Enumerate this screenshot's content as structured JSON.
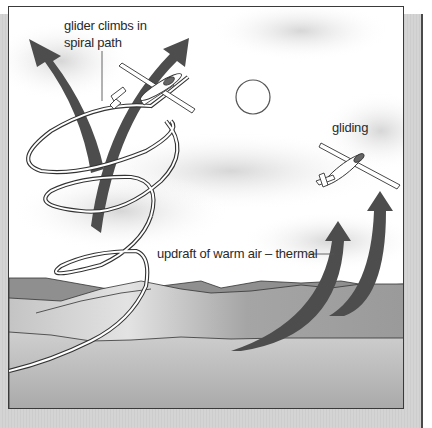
{
  "diagram": {
    "labels": {
      "spiral": "glider climbs in\nspiral path",
      "gliding": "gliding",
      "thermal": "updraft of warm air – thermal"
    },
    "elements": {
      "sun": "sun-outline",
      "glider_climbing": "glider-climbing-in-spiral",
      "glider_gliding": "glider-gliding",
      "arrows_left": "two-upward-updraft-arrows-crossing",
      "arrows_right": "two-curved-updraft-arrows-from-hills",
      "spiral_path": "spiral-flight-path",
      "clouds": "soft-gray-clouds",
      "hills": "gray-rolling-hills"
    },
    "colors": {
      "arrow": "#4d4d4d",
      "frame_border": "#3a3a3a",
      "panel": "#d2d2d2",
      "hill_dark": "#8e8e8e",
      "hill_mid": "#a8a8a8",
      "hill_light": "#bdbdbd",
      "ground": "#b4b4b4",
      "text": "#2a2a2a"
    }
  }
}
